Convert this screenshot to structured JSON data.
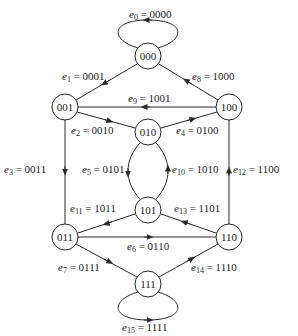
{
  "diagram": {
    "type": "state-transition-graph",
    "nodes": [
      {
        "id": "000",
        "label": "000",
        "x": 148,
        "y": 56
      },
      {
        "id": "001",
        "label": "001",
        "x": 65,
        "y": 107
      },
      {
        "id": "100",
        "label": "100",
        "x": 229,
        "y": 107
      },
      {
        "id": "010",
        "label": "010",
        "x": 148,
        "y": 132
      },
      {
        "id": "101",
        "label": "101",
        "x": 148,
        "y": 210
      },
      {
        "id": "011",
        "label": "011",
        "x": 65,
        "y": 237
      },
      {
        "id": "110",
        "label": "110",
        "x": 229,
        "y": 237
      },
      {
        "id": "111",
        "label": "111",
        "x": 148,
        "y": 284
      }
    ],
    "edges": [
      {
        "name": "e",
        "sub": "0",
        "value": "0000",
        "from": "000",
        "to": "000",
        "eq": " = "
      },
      {
        "name": "e",
        "sub": "1",
        "value": "0001",
        "from": "000",
        "to": "001",
        "eq": " = "
      },
      {
        "name": "e",
        "sub": "2",
        "value": "0010",
        "from": "001",
        "to": "010",
        "eq": " = "
      },
      {
        "name": "e",
        "sub": "3",
        "value": "0011",
        "from": "001",
        "to": "011",
        "eq": " = "
      },
      {
        "name": "e",
        "sub": "4",
        "value": "0100",
        "from": "010",
        "to": "100",
        "eq": " = "
      },
      {
        "name": "e",
        "sub": "5",
        "value": "0101",
        "from": "010",
        "to": "101",
        "eq": " = "
      },
      {
        "name": "e",
        "sub": "6",
        "value": "0110",
        "from": "011",
        "to": "110",
        "eq": " = "
      },
      {
        "name": "e",
        "sub": "7",
        "value": "0111",
        "from": "011",
        "to": "111",
        "eq": " = "
      },
      {
        "name": "e",
        "sub": "8",
        "value": "1000",
        "from": "100",
        "to": "000",
        "eq": " = "
      },
      {
        "name": "e",
        "sub": "9",
        "value": "1001",
        "from": "100",
        "to": "001",
        "eq": " = "
      },
      {
        "name": "e",
        "sub": "10",
        "value": "1010",
        "from": "101",
        "to": "010",
        "eq": " = "
      },
      {
        "name": "e",
        "sub": "11",
        "value": "1011",
        "from": "101",
        "to": "011",
        "eq": " = "
      },
      {
        "name": "e",
        "sub": "12",
        "value": "1100",
        "from": "110",
        "to": "100",
        "eq": " = "
      },
      {
        "name": "e",
        "sub": "13",
        "value": "1101",
        "from": "110",
        "to": "101",
        "eq": " = "
      },
      {
        "name": "e",
        "sub": "14",
        "value": "1110",
        "from": "111",
        "to": "110",
        "eq": " = "
      },
      {
        "name": "e",
        "sub": "15",
        "value": "1111",
        "from": "111",
        "to": "111",
        "eq": " = "
      }
    ]
  }
}
